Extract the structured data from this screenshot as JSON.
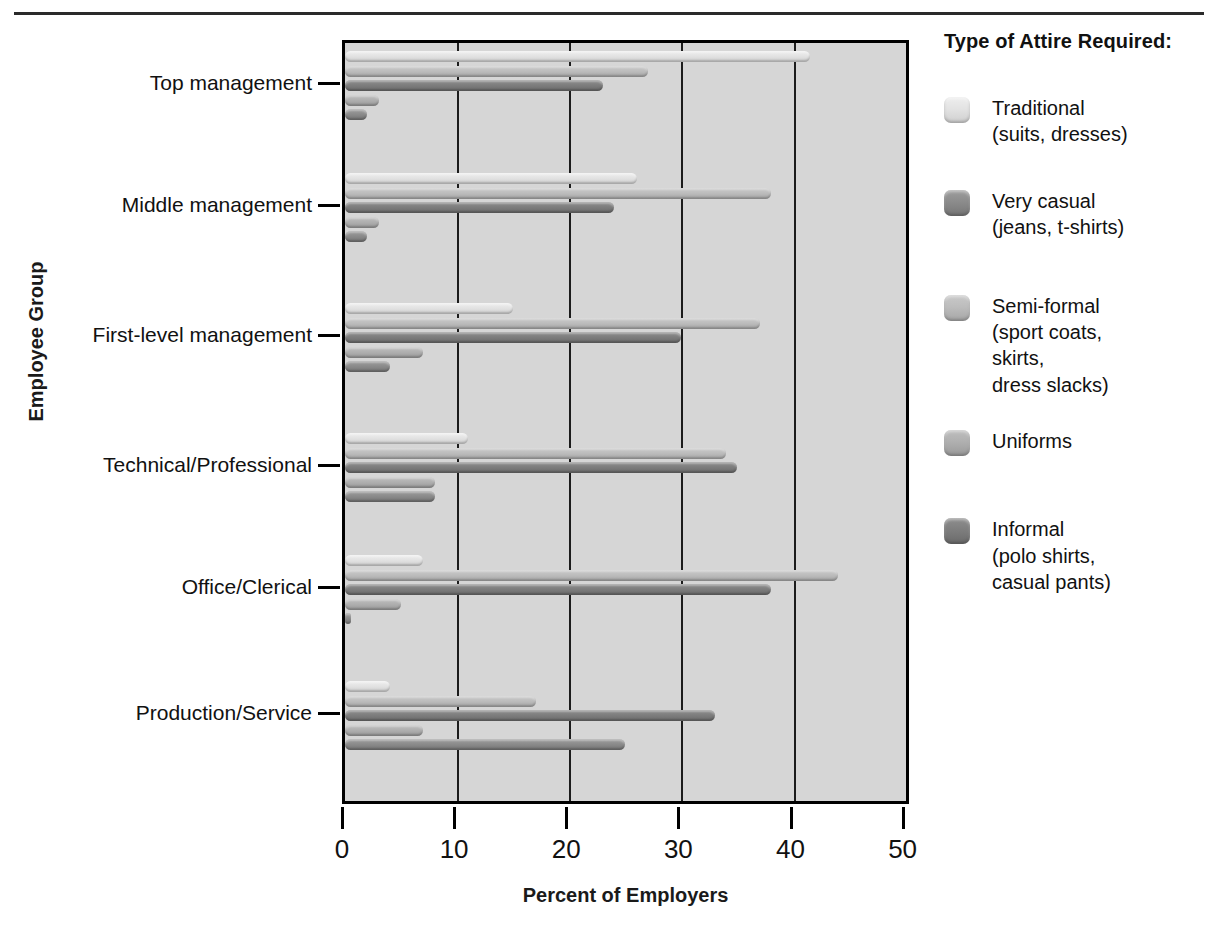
{
  "chart_data": {
    "type": "bar",
    "orientation": "horizontal",
    "title": "",
    "xlabel": "Percent of Employers",
    "ylabel": "Employee Group",
    "xlim": [
      0,
      50
    ],
    "xticks": [
      0,
      10,
      20,
      30,
      40,
      50
    ],
    "xtick_labels": [
      "0",
      "10",
      "20",
      "30",
      "40",
      "50"
    ],
    "grid": "vertical",
    "legend_position": "right",
    "legend_title": "Type of Attire Required:",
    "categories": [
      "Top management",
      "Middle management",
      "First-level management",
      "Technical/Professional",
      "Office/Clerical",
      "Production/Service"
    ],
    "series": [
      {
        "name": "Traditional (suits, dresses)",
        "short": "Traditional",
        "color": "#e3e3e3",
        "values": [
          41.5,
          26.0,
          15.0,
          11.0,
          7.0,
          4.0
        ]
      },
      {
        "name": "Very casual (jeans, t-shirts)",
        "short": "Very casual",
        "color": "#8c8c8c",
        "values": [
          2.0,
          2.0,
          4.0,
          8.0,
          0.5,
          25.0
        ]
      },
      {
        "name": "Semi-formal (sport coats, skirts, dress slacks)",
        "short": "Semi-formal",
        "color": "#bdbdbd",
        "values": [
          27.0,
          38.0,
          37.0,
          34.0,
          44.0,
          17.0
        ]
      },
      {
        "name": "Uniforms",
        "short": "Uniforms",
        "color": "#b0b0b0",
        "values": [
          3.0,
          3.0,
          7.0,
          8.0,
          5.0,
          7.0
        ]
      },
      {
        "name": "Informal (polo shirts, casual pants)",
        "short": "Informal",
        "color": "#7e7e7e",
        "values": [
          23.0,
          24.0,
          30.0,
          35.0,
          38.0,
          33.0
        ]
      }
    ],
    "bar_draw_order": [
      "Traditional",
      "Semi-formal",
      "Informal",
      "Uniforms",
      "Very casual"
    ]
  },
  "axes": {
    "x_title": "Percent of Employers",
    "y_title": "Employee Group",
    "x_tick_labels": [
      "0",
      "10",
      "20",
      "30",
      "40",
      "50"
    ],
    "y_tick_labels": [
      "Top management",
      "Middle management",
      "First-level management",
      "Technical/Professional",
      "Office/Clerical",
      "Production/Service"
    ]
  },
  "legend": {
    "title": "Type of Attire Required:",
    "items": [
      {
        "label": "Traditional",
        "sub": "(suits, dresses)",
        "swatch_class": "s0"
      },
      {
        "label": "Very casual",
        "sub": "(jeans, t-shirts)",
        "swatch_class": "s1"
      },
      {
        "label": "Semi-formal",
        "sub": "(sport coats,",
        "sub2": "skirts,",
        "sub3": "dress slacks)",
        "swatch_class": "s2"
      },
      {
        "label": "Uniforms",
        "sub": "",
        "swatch_class": "s3"
      },
      {
        "label": "Informal",
        "sub": "(polo shirts,",
        "sub2": "casual pants)",
        "swatch_class": "s4"
      }
    ]
  }
}
